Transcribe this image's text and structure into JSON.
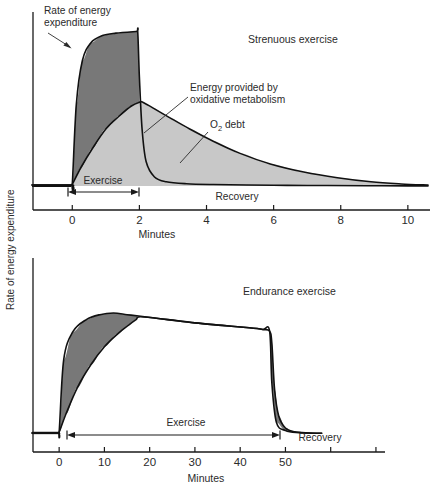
{
  "figure": {
    "y_axis_label": "Rate of energy expenditure",
    "background": "#ffffff",
    "ink_color": "#111111",
    "dark_fill": "#787878",
    "light_fill": "#c8c8c8"
  },
  "chart_data": [
    {
      "type": "area",
      "title": "Strenuous exercise",
      "xlabel": "Minutes",
      "ylabel": "Rate of energy expenditure",
      "xlim": [
        -1.2,
        10.6
      ],
      "ylim": [
        0,
        1.12
      ],
      "xticks": [
        0,
        2,
        4,
        6,
        8,
        10
      ],
      "xtick_labels": [
        "0",
        "2",
        "4",
        "6",
        "8",
        "10"
      ],
      "grid": false,
      "legend": "none",
      "annotations": [
        {
          "name": "rate-of-energy-expenditure-callout",
          "text": "Rate of energy\nexpenditure",
          "line1": "Rate of energy",
          "line2": "expenditure"
        },
        {
          "name": "oxidative-metabolism-callout",
          "text": "Energy provided by\noxidative metabolism",
          "line1": "Energy provided by",
          "line2": "oxidative metabolism"
        },
        {
          "name": "o2-debt-callout",
          "text": "O2 debt",
          "prefix": "O",
          "subscript": "2",
          "suffix": " debt"
        },
        {
          "name": "exercise-span-label",
          "text": "Exercise"
        },
        {
          "name": "recovery-span-label",
          "text": "Recovery"
        }
      ],
      "series": [
        {
          "name": "Total rate of energy expenditure",
          "description": "Abrupt rise at 0 min to plateau, sustained to 2 min, abrupt fall then slow return toward baseline",
          "x": [
            -1.2,
            -0.05,
            0.0,
            0.12,
            0.3,
            0.55,
            0.9,
            1.3,
            1.9,
            1.95,
            2.0,
            2.08,
            2.2,
            2.45,
            2.8,
            3.4,
            4.2,
            5.2,
            6.4,
            7.6,
            8.8,
            10.0,
            10.6
          ],
          "y": [
            0.055,
            0.055,
            0.06,
            0.55,
            0.82,
            0.93,
            0.975,
            0.99,
            1.0,
            1.0,
            0.72,
            0.4,
            0.2,
            0.105,
            0.075,
            0.063,
            0.058,
            0.055,
            0.053,
            0.052,
            0.051,
            0.05,
            0.05
          ]
        },
        {
          "name": "Energy provided by oxidative metabolism",
          "description": "Slow exponential rise during exercise peaking just after 2 min, then slow exponential decay through recovery",
          "x": [
            -1.2,
            -0.05,
            0.0,
            0.25,
            0.6,
            1.0,
            1.4,
            1.75,
            2.0,
            2.1,
            2.4,
            2.9,
            3.5,
            4.2,
            5.0,
            5.9,
            6.9,
            7.9,
            8.9,
            9.8,
            10.6
          ],
          "y": [
            0.055,
            0.055,
            0.06,
            0.16,
            0.28,
            0.4,
            0.48,
            0.54,
            0.565,
            0.565,
            0.53,
            0.47,
            0.4,
            0.325,
            0.25,
            0.185,
            0.135,
            0.1,
            0.075,
            0.062,
            0.055
          ]
        }
      ],
      "regions": [
        {
          "name": "o2-deficit-and-debt-dark-region",
          "fill": "#787878",
          "meaning": "Energy not provided by oxidative metabolism (O2 deficit during exercise)"
        },
        {
          "name": "oxidative-metabolism-light-region",
          "fill": "#c8c8c8",
          "meaning": "Energy provided by oxidative metabolism / O2 debt repayment"
        }
      ],
      "spans": [
        {
          "name": "exercise",
          "label": "Exercise",
          "from": 0,
          "to": 2
        },
        {
          "name": "recovery",
          "label": "Recovery",
          "from": 2,
          "to": 10.4
        }
      ]
    },
    {
      "type": "area",
      "title": "Endurance exercise",
      "xlabel": "Minutes",
      "ylabel": "Rate of energy expenditure",
      "xlim": [
        -6,
        72
      ],
      "ylim": [
        0,
        1.12
      ],
      "xticks": [
        0,
        10,
        20,
        30,
        40,
        50,
        60,
        70
      ],
      "xtick_labels": [
        "0",
        "10",
        "20",
        "30",
        "40",
        "50",
        "",
        ""
      ],
      "grid": false,
      "legend": "none",
      "annotations": [
        {
          "name": "exercise-span-label",
          "text": "Exercise"
        },
        {
          "name": "recovery-span-label",
          "text": "Recovery"
        }
      ],
      "series": [
        {
          "name": "Total rate of energy expenditure",
          "description": "Rapid rise at 0 min to a broad plateau that slowly declines, then sharp fall at 47 min back to baseline",
          "x": [
            -6,
            -0.4,
            0,
            1.0,
            3.0,
            6.0,
            9.0,
            12.0,
            15.0,
            18.0,
            24.0,
            30.0,
            36.0,
            42.0,
            45.0,
            46.5,
            47.0,
            47.6,
            48.5,
            50.0,
            52.0,
            55.0,
            58.0
          ],
          "y": [
            0.055,
            0.055,
            0.06,
            0.5,
            0.67,
            0.745,
            0.775,
            0.785,
            0.775,
            0.765,
            0.745,
            0.725,
            0.71,
            0.695,
            0.685,
            0.675,
            0.6,
            0.32,
            0.16,
            0.085,
            0.062,
            0.055,
            0.053
          ]
        },
        {
          "name": "Energy provided by oxidative metabolism",
          "description": "Slower rise merging with total curve by about 17 min, then tracks the total curve until the end of exercise",
          "x": [
            -6,
            -0.4,
            0,
            1.5,
            4.0,
            7.0,
            10.0,
            13.0,
            15.5,
            17.0,
            18.0,
            24.0,
            30.0,
            36.0,
            42.0,
            45.0,
            46.5,
            47.0,
            48.0,
            50.0,
            53.0,
            58.0
          ],
          "y": [
            0.055,
            0.055,
            0.06,
            0.17,
            0.33,
            0.47,
            0.58,
            0.66,
            0.715,
            0.745,
            0.762,
            0.745,
            0.725,
            0.71,
            0.695,
            0.685,
            0.675,
            0.36,
            0.12,
            0.07,
            0.057,
            0.053
          ]
        }
      ],
      "regions": [
        {
          "name": "o2-deficit-dark-region",
          "fill": "#787878",
          "meaning": "O2 deficit at onset of endurance exercise"
        },
        {
          "name": "o2-debt-dark-region",
          "fill": "#787878",
          "meaning": "O2 debt repaid after endurance exercise"
        }
      ],
      "spans": [
        {
          "name": "exercise",
          "label": "Exercise",
          "from": 0,
          "to": 46.5
        },
        {
          "name": "recovery",
          "label": "Recovery",
          "from": 47,
          "to": 58
        }
      ]
    }
  ]
}
